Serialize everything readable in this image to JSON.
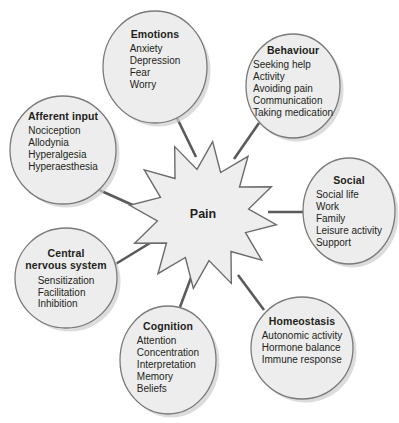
{
  "diagram": {
    "title": "Pain",
    "center": {
      "label": "Pain",
      "shape": "starburst",
      "cx": 203,
      "cy": 215,
      "r_outer": 74,
      "r_inner": 46,
      "points": 12,
      "fill": "#eeeeee",
      "stroke": "#6b6b6b"
    },
    "style": {
      "background": "#ffffff",
      "node_fill": "#ededed",
      "node_stroke": "#7a7a7a",
      "shadow_color": "#cfcfcf",
      "connector_color": "#5a5a5a",
      "text_color": "#231f20"
    },
    "nodes": [
      {
        "id": "emotions",
        "title": "Emotions",
        "items": [
          "Anxiety",
          "Depression",
          "Fear",
          "Worry"
        ],
        "cx": 155,
        "cy": 67,
        "rx": 52,
        "ry": 56,
        "text_y": 28,
        "connect_from": [
          177,
          118
        ],
        "connect_to": [
          196,
          157
        ]
      },
      {
        "id": "behaviour",
        "title": "Behaviour",
        "items": [
          "Seeking help",
          "Activity",
          "Avoiding pain",
          "Communication",
          "Taking medication"
        ],
        "cx": 293,
        "cy": 86,
        "rx": 47,
        "ry": 52,
        "text_y": 44,
        "connect_from": [
          259,
          123
        ],
        "connect_to": [
          234,
          159
        ]
      },
      {
        "id": "social",
        "title": "Social",
        "items": [
          "Social life",
          "Work",
          "Family",
          "Leisure activity",
          "Support"
        ],
        "cx": 349,
        "cy": 211,
        "rx": 46,
        "ry": 53,
        "text_y": 174,
        "connect_from": [
          303,
          212
        ],
        "connect_to": [
          268,
          212
        ]
      },
      {
        "id": "homeostasis",
        "title": "Homeostasis",
        "items": [
          "Autonomic activity",
          "Hormone balance",
          "Immune response"
        ],
        "cx": 302,
        "cy": 348,
        "rx": 51,
        "ry": 51,
        "text_y": 315,
        "connect_from": [
          264,
          310
        ],
        "connect_to": [
          238,
          275
        ]
      },
      {
        "id": "cognition",
        "title": "Cognition",
        "items": [
          "Attention",
          "Concentration",
          "Interpretation",
          "Memory",
          "Beliefs"
        ],
        "cx": 168,
        "cy": 360,
        "rx": 48,
        "ry": 54,
        "text_y": 320,
        "connect_from": [
          180,
          307
        ],
        "connect_to": [
          192,
          275
        ]
      },
      {
        "id": "central-nervous-system",
        "title": "Central\nnervous system",
        "items": [
          "Sensitization",
          "Facilitation",
          "Inhibition"
        ],
        "cx": 66,
        "cy": 278,
        "rx": 51,
        "ry": 50,
        "text_y": 247,
        "connect_from": [
          114,
          265
        ],
        "connect_to": [
          150,
          243
        ]
      },
      {
        "id": "afferent-input",
        "title": "Afferent input",
        "items": [
          "Nociception",
          "Allodynia",
          "Hyperalgesia",
          "Hyperaesthesia"
        ],
        "cx": 63,
        "cy": 150,
        "rx": 53,
        "ry": 54,
        "text_y": 110,
        "connect_from": [
          97,
          189
        ],
        "connect_to": [
          148,
          212
        ]
      }
    ]
  }
}
